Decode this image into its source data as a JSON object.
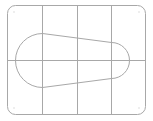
{
  "diagram": {
    "type": "technical-drawing",
    "colors": {
      "background": "#ffffff",
      "stroke": "#a8a8a8",
      "dots": "#d0d0d0"
    },
    "outline": {
      "x": 7,
      "y": 5,
      "width": 139,
      "height": 110,
      "corner_radius": 8
    },
    "grid": {
      "vertical_lines_x": [
        42,
        77,
        111
      ],
      "horizontal_lines_y": [
        60
      ]
    },
    "slot": {
      "left_center": [
        42,
        60
      ],
      "left_radius": 27,
      "right_center": [
        111,
        60
      ],
      "right_radius": 18
    },
    "corner_dots": [
      [
        14,
        12
      ],
      [
        139,
        12
      ],
      [
        14,
        108
      ],
      [
        139,
        108
      ]
    ]
  }
}
